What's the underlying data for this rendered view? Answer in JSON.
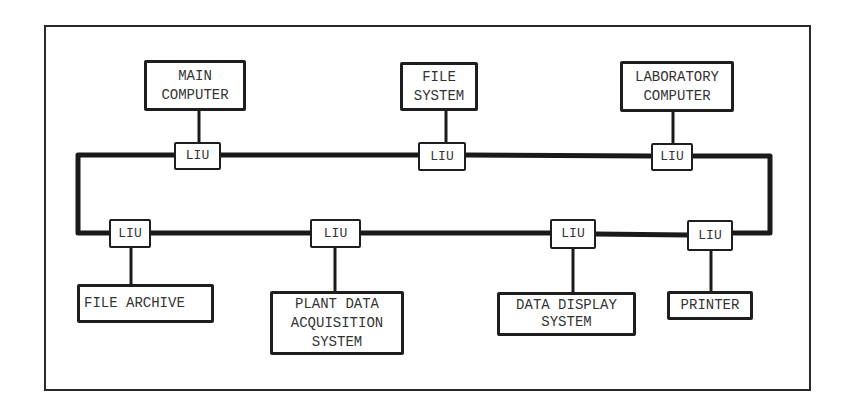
{
  "diagram": {
    "type": "ring network topology",
    "frame": {
      "present": true
    },
    "bus": {
      "shape": "closed ring",
      "color": "#1a1a1a"
    },
    "liu_label": "LIU",
    "top_nodes": [
      {
        "id": "main-computer",
        "lines": [
          "MAIN",
          "COMPUTER"
        ]
      },
      {
        "id": "file-system",
        "lines": [
          "FILE",
          "SYSTEM"
        ]
      },
      {
        "id": "laboratory-computer",
        "lines": [
          "LABORATORY",
          "COMPUTER"
        ]
      }
    ],
    "bottom_nodes": [
      {
        "id": "file-archive",
        "lines": [
          "FILE ARCHIVE"
        ]
      },
      {
        "id": "plant-data-acquisition-system",
        "lines": [
          "PLANT DATA",
          "ACQUISITION",
          "SYSTEM"
        ]
      },
      {
        "id": "data-display-system",
        "lines": [
          "DATA DISPLAY",
          "SYSTEM"
        ]
      },
      {
        "id": "printer",
        "lines": [
          "PRINTER"
        ]
      }
    ],
    "lius": [
      {
        "label": "LIU",
        "attached_to": "main-computer"
      },
      {
        "label": "LIU",
        "attached_to": "file-system"
      },
      {
        "label": "LIU",
        "attached_to": "laboratory-computer"
      },
      {
        "label": "LIU",
        "attached_to": "file-archive"
      },
      {
        "label": "LIU",
        "attached_to": "plant-data-acquisition-system"
      },
      {
        "label": "LIU",
        "attached_to": "data-display-system"
      },
      {
        "label": "LIU",
        "attached_to": "printer"
      }
    ]
  }
}
